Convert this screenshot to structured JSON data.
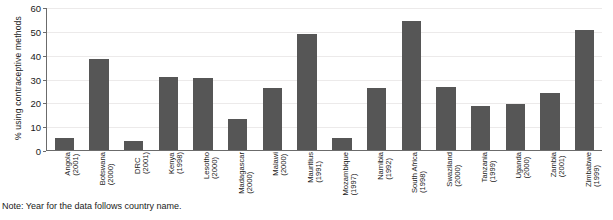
{
  "chart_data": {
    "type": "bar",
    "title": "",
    "xlabel": "",
    "ylabel": "% using contraceptive methods",
    "ylim": [
      0,
      60
    ],
    "yticks": [
      0,
      10,
      20,
      30,
      40,
      50,
      60
    ],
    "grid": true,
    "legend": false,
    "bar_color": "#565656",
    "categories": [
      "Angola (2001)",
      "Botswana (2000)",
      "DRC (2001)",
      "Kenya (1998)",
      "Lesotho (2000)",
      "Madagascar (2000)",
      "Malawi (2000)",
      "Mauritius (1991)",
      "Mozambique (1997)",
      "Namibia (1992)",
      "South Africa (1998)",
      "Swaziland (2000)",
      "Tanzania (1999)",
      "Uganda (2000)",
      "Zambia (2001)",
      "Zimbabwe (1999)"
    ],
    "country_labels": [
      {
        "country": "Angola",
        "year": "(2001)"
      },
      {
        "country": "Botswana",
        "year": "(2000)"
      },
      {
        "country": "DRC",
        "year": "(2001)"
      },
      {
        "country": "Kenya",
        "year": "(1998)"
      },
      {
        "country": "Lesotho",
        "year": "(2000)"
      },
      {
        "country": "Madagascar",
        "year": "(2000)"
      },
      {
        "country": "Malawi",
        "year": "(2000)"
      },
      {
        "country": "Mauritius",
        "year": "(1991)"
      },
      {
        "country": "Mozambique",
        "year": "(1997)"
      },
      {
        "country": "Namibia",
        "year": "(1992)"
      },
      {
        "country": "South Africa",
        "year": "(1998)"
      },
      {
        "country": "Swaziland",
        "year": "(2000)"
      },
      {
        "country": "Tanzania",
        "year": "(1999)"
      },
      {
        "country": "Uganda",
        "year": "(2000)"
      },
      {
        "country": "Zambia",
        "year": "(2001)"
      },
      {
        "country": "Zimbabwe",
        "year": "(1999)"
      }
    ],
    "values": [
      5,
      38.5,
      4,
      31,
      30.5,
      13,
      26,
      49,
      5,
      26,
      54.5,
      26.5,
      18.5,
      19.5,
      24,
      50.5
    ]
  },
  "note": "Note: Year for the data follows country name."
}
